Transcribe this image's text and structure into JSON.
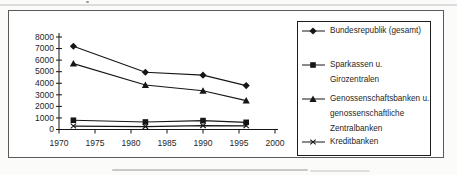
{
  "figure": {
    "background": "#ffffff",
    "frame_border_color": "#5a5a5a",
    "line_color": "#161616",
    "text_color": "#1f1f1f"
  },
  "chart_data": {
    "type": "line",
    "x": [
      1972,
      1982,
      1990,
      1996
    ],
    "series": [
      {
        "name": "Bundesrepublik (gesamt)",
        "marker": "diamond",
        "values": [
          7200,
          4950,
          4700,
          3800
        ]
      },
      {
        "name": "Sparkassen u. Girozentralen",
        "marker": "square",
        "values": [
          800,
          650,
          770,
          620
        ]
      },
      {
        "name": "Genossenschaftsbanken u. genossenschaftliche Zentralbanken",
        "marker": "triangle",
        "values": [
          5700,
          3850,
          3350,
          2500
        ]
      },
      {
        "name": "Kreditbanken",
        "marker": "x-cross",
        "values": [
          300,
          250,
          340,
          320
        ]
      }
    ],
    "title": "",
    "xlabel": "",
    "ylabel": "",
    "xlim": [
      1970,
      2000
    ],
    "ylim": [
      0,
      8000
    ],
    "x_ticks": [
      1970,
      1975,
      1980,
      1985,
      1990,
      1995,
      2000
    ],
    "y_ticks": [
      0,
      1000,
      2000,
      3000,
      4000,
      5000,
      6000,
      7000,
      8000
    ],
    "grid": false,
    "legend_position": "right"
  },
  "legend": {
    "items": [
      {
        "marker": "diamond",
        "label": "Bundesrepublik (gesamt)"
      },
      {
        "marker": "square",
        "label": "Sparkassen u. Girozentralen"
      },
      {
        "marker": "triangle",
        "label": "Genossenschaftsbanken u.\ngenossenschaftliche\nZentralbanken"
      },
      {
        "marker": "x-cross",
        "label": "Kreditbanken"
      }
    ]
  }
}
